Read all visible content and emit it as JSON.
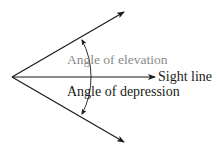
{
  "diagram": {
    "type": "angle-of-elevation-depression",
    "labels": {
      "elevation": "Angle of elevation",
      "sight_line": "Sight line",
      "depression": "Angle of depression"
    },
    "colors": {
      "lines": "#1a1a1a",
      "elevation_label": "#8a8a8a",
      "depression_label": "#1a1a1a",
      "sight_label": "#1a1a1a",
      "background": "#ffffff"
    }
  }
}
